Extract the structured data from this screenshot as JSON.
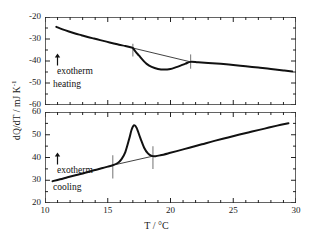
{
  "chart_data": {
    "type": "line",
    "title": "",
    "xlabel": "T / °C",
    "ylabel": "dQ/dT / mJ K",
    "ylabel_sup": "-1",
    "xlim": [
      10,
      30
    ],
    "xticks": [
      10,
      15,
      20,
      25,
      30
    ],
    "xtick_labels": [
      "10",
      "15",
      "20",
      "25",
      "30"
    ],
    "grid": false,
    "legend_position": "none",
    "panels": [
      {
        "name": "heating",
        "label": "heating",
        "exotherm_label": "exotherm",
        "exotherm_arrow": "up-arrow",
        "ylim": [
          -60,
          -20
        ],
        "yticks": [
          -20,
          -30,
          -40,
          -50,
          -60
        ],
        "ytick_labels": [
          "-20",
          "-30",
          "-40",
          "-50",
          "-60"
        ],
        "series": [
          {
            "name": "heating scan",
            "x": [
              10.9,
              11.4,
              11.9,
              12.4,
              12.9,
              13.4,
              13.9,
              14.4,
              14.9,
              15.4,
              15.9,
              16.4,
              16.9,
              17.0,
              17.2,
              17.5,
              17.8,
              18.1,
              18.5,
              19.0,
              19.5,
              20.0,
              20.4,
              20.8,
              21.2,
              21.6,
              22.2,
              23.0,
              24.0,
              25.0,
              26.0,
              27.0,
              28.0,
              29.0,
              29.7
            ],
            "y": [
              -24.5,
              -25.6,
              -26.6,
              -27.5,
              -28.3,
              -29.1,
              -29.8,
              -30.5,
              -31.2,
              -31.9,
              -32.6,
              -33.2,
              -33.9,
              -34.1,
              -35.6,
              -37.6,
              -39.6,
              -41.3,
              -42.7,
              -43.6,
              -43.9,
              -43.6,
              -42.9,
              -42.1,
              -41.2,
              -40.4,
              -40.6,
              -40.9,
              -41.3,
              -41.8,
              -42.4,
              -43.0,
              -43.6,
              -44.3,
              -44.8
            ]
          },
          {
            "name": "baseline chord",
            "x": [
              17.0,
              21.6
            ],
            "y": [
              -34.1,
              -40.4
            ]
          }
        ],
        "markers": [
          {
            "name": "onset-marker",
            "x": 17.0,
            "y_top": -32.2,
            "y_bottom": -38.0
          },
          {
            "name": "endset-marker",
            "x": 21.6,
            "y_top": -37.0,
            "y_bottom": -43.5
          }
        ],
        "peak_extremum": {
          "x": 19.5,
          "y": -43.9,
          "kind": "endothermic-dip"
        }
      },
      {
        "name": "cooling",
        "label": "cooling",
        "exotherm_label": "exotherm",
        "exotherm_arrow": "up-arrow",
        "ylim": [
          20,
          60
        ],
        "yticks": [
          60,
          50,
          40,
          30,
          20
        ],
        "ytick_labels": [
          "60",
          "50",
          "40",
          "30",
          "20"
        ],
        "series": [
          {
            "name": "cooling scan",
            "x": [
              10.6,
              11.2,
              11.8,
              12.5,
              13.2,
              13.9,
              14.6,
              15.0,
              15.4,
              15.8,
              16.1,
              16.4,
              16.7,
              16.9,
              17.1,
              17.3,
              17.6,
              17.9,
              18.2,
              18.5,
              18.8,
              19.2,
              19.8,
              20.5,
              21.5,
              22.5,
              23.5,
              24.5,
              25.5,
              26.5,
              27.5,
              28.5,
              29.4
            ],
            "y": [
              29.6,
              30.4,
              31.3,
              32.3,
              33.3,
              34.4,
              35.4,
              36.0,
              36.6,
              37.6,
              39.3,
              42.4,
              48.0,
              52.2,
              54.2,
              53.0,
              48.5,
              44.3,
              41.8,
              40.7,
              40.6,
              41.0,
              41.8,
              42.8,
              44.3,
              45.8,
              47.3,
              48.7,
              50.1,
              51.4,
              52.7,
              54.0,
              55.1
            ]
          },
          {
            "name": "baseline chord",
            "x": [
              15.4,
              18.6
            ],
            "y": [
              36.6,
              40.6
            ]
          }
        ],
        "markers": [
          {
            "name": "onset-marker",
            "x": 15.4,
            "y_top": 41.0,
            "y_bottom": 30.8
          },
          {
            "name": "endset-marker",
            "x": 18.6,
            "y_top": 45.0,
            "y_bottom": 35.0
          }
        ],
        "peak_extremum": {
          "x": 17.1,
          "y": 54.2,
          "kind": "exothermic-peak"
        }
      }
    ]
  },
  "colors": {
    "curve": "#111111",
    "axis": "#222222",
    "marker": "#8a8a8a",
    "baseline": "#111111",
    "background": "#ffffff"
  }
}
